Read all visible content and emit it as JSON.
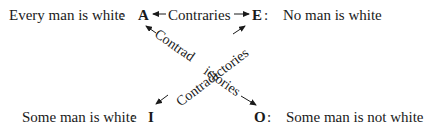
{
  "diagram": {
    "type": "square-of-opposition",
    "corners": {
      "A": {
        "letter": "A",
        "proposition": "Every man is white",
        "separator": ":"
      },
      "E": {
        "letter": "E",
        "proposition": "No man is white",
        "separator": ":"
      },
      "I": {
        "letter": "I",
        "proposition": "Some man is white",
        "separator": ":"
      },
      "O": {
        "letter": "O",
        "proposition": "Some man is not white",
        "separator": ":"
      }
    },
    "relations": {
      "top": {
        "label": "Contraries",
        "from": "A",
        "to": "E",
        "arrows": "both"
      },
      "diag_a_o": {
        "label_part1": "Contrad",
        "label_part2": "ictories",
        "full_label": "Contradictories",
        "from": "A",
        "to": "O",
        "arrows": "both"
      },
      "diag_e_i": {
        "label": "Contradictories",
        "from": "E",
        "to": "I",
        "arrows": "both"
      }
    },
    "ink_color": "#1a1a1a",
    "background_color": "#ffffff"
  }
}
